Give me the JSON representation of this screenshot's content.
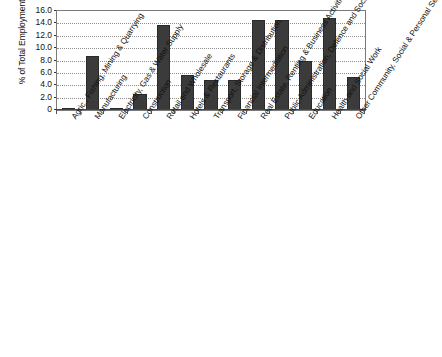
{
  "chart_data": {
    "type": "bar",
    "title": "",
    "subtitle": "",
    "xlabel": "",
    "ylabel": "% of Total Employment",
    "ylim": [
      0,
      16
    ],
    "ytick_labels": [
      "16.0",
      "14.0",
      "12.0",
      "10.0",
      "8.0",
      "6.0",
      "4.0",
      "2.0",
      "0"
    ],
    "ytick_values": [
      16.0,
      14.0,
      12.0,
      10.0,
      8.0,
      6.0,
      4.0,
      2.0,
      0
    ],
    "grid": true,
    "legend": "none",
    "bar_color": "#3b3b3b",
    "categories": [
      "Agric., Fishing, Mining & Quarrying",
      "Manufacturing",
      "Electricity, Gas & Water Supply",
      "Construction",
      "Retail and Wholesale",
      "Hotels & Restaurants",
      "Transport, Storage & Distribution",
      "Financial Intermediation",
      "Real Estate, Renting & Business Activities",
      "Public Administration, Defence and Social Security",
      "Education",
      "Health and Social Work",
      "Other Community, Social & Personal Service Activities"
    ],
    "values": [
      0.2,
      8.7,
      0.4,
      2.6,
      13.8,
      5.6,
      4.9,
      4.9,
      14.6,
      14.6,
      7.9,
      14.8,
      5.4
    ]
  }
}
